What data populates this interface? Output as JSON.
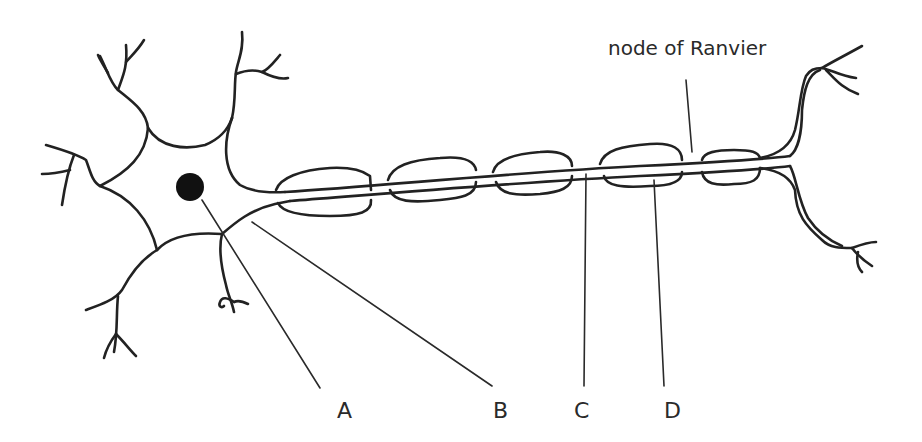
{
  "diagram": {
    "line_color": "#222222",
    "background": "#ffffff",
    "labels": {
      "node": "node  of Ranvier",
      "a": "A",
      "b": "B",
      "c": "C",
      "d": "D"
    },
    "parts": [
      {
        "id": "A",
        "points_to": "nucleus"
      },
      {
        "id": "B",
        "points_to": "axon hillock / cell body edge"
      },
      {
        "id": "C",
        "points_to": "axon"
      },
      {
        "id": "D",
        "points_to": "myelin sheath segment"
      },
      {
        "id": "node of Ranvier",
        "points_to": "gap between myelin segments"
      }
    ],
    "myelin_segment_count": 5
  }
}
